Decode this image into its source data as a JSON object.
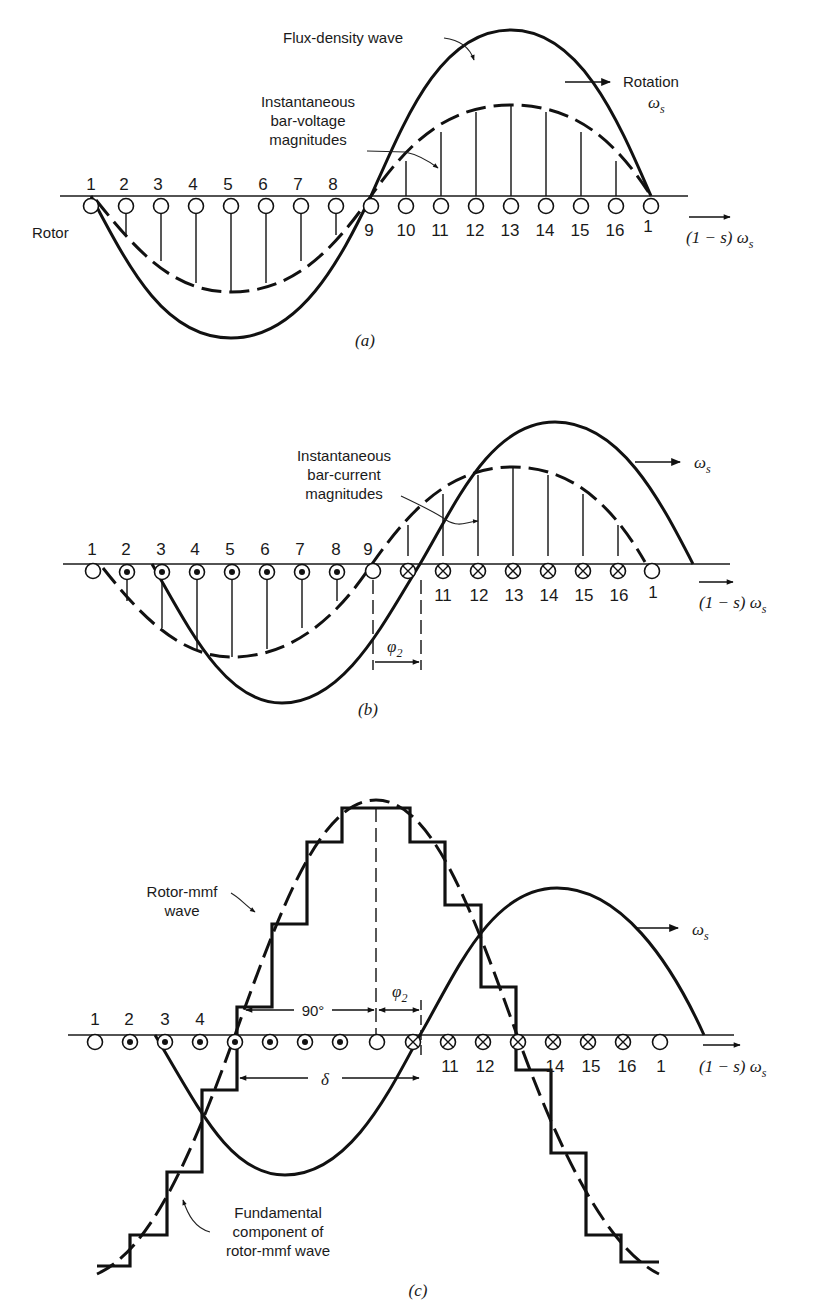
{
  "figure": {
    "panels": [
      {
        "id": "a",
        "caption": "(a)",
        "labels": {
          "flux_wave": "Flux-density wave",
          "bar_voltage": [
            "Instantaneous",
            "bar-voltage",
            "magnitudes"
          ],
          "rotation": "Rotation",
          "omega_s": "ω",
          "omega_sub": "s",
          "rotor": "Rotor",
          "rotor_speed": "(1 − s) ω",
          "rotor_speed_sub": "s"
        },
        "bar_numbers_top": [
          "1",
          "2",
          "3",
          "4",
          "5",
          "6",
          "7",
          "8"
        ],
        "bar_numbers_bottom": [
          "9",
          "10",
          "11",
          "12",
          "13",
          "14",
          "15",
          "16",
          "1"
        ],
        "conductor_symbols": [
          "open",
          "open",
          "open",
          "open",
          "open",
          "open",
          "open",
          "open",
          "open",
          "open",
          "open",
          "open",
          "open",
          "open",
          "open",
          "open",
          "open"
        ]
      },
      {
        "id": "b",
        "caption": "(b)",
        "labels": {
          "bar_current": [
            "Instantaneous",
            "bar-current",
            "magnitudes"
          ],
          "omega_s": "ω",
          "omega_sub": "s",
          "phi2": "φ",
          "phi2_sub": "2",
          "rotor_speed": "(1 − s) ω",
          "rotor_speed_sub": "s"
        },
        "bar_numbers_top": [
          "1",
          "2",
          "3",
          "4",
          "5",
          "6",
          "7",
          "8",
          "9"
        ],
        "bar_numbers_bottom": [
          "11",
          "12",
          "13",
          "14",
          "15",
          "16",
          "1"
        ],
        "conductor_symbols": [
          "open",
          "dot",
          "dot",
          "dot",
          "dot",
          "dot",
          "dot",
          "dot",
          "open",
          "cross",
          "cross",
          "cross",
          "cross",
          "cross",
          "cross",
          "cross",
          "open"
        ]
      },
      {
        "id": "c",
        "caption": "(c)",
        "labels": {
          "rotor_mmf": [
            "Rotor-mmf",
            "wave"
          ],
          "fundamental": [
            "Fundamental",
            "component of",
            "rotor-mmf wave"
          ],
          "angle_90": "90°",
          "delta": "δ",
          "phi2": "φ",
          "phi2_sub": "2",
          "omega_s": "ω",
          "omega_sub": "s",
          "rotor_speed": "(1 − s) ω",
          "rotor_speed_sub": "s"
        },
        "bar_numbers_top": [
          "1",
          "2",
          "3",
          "4"
        ],
        "bar_numbers_bottom": [
          "11",
          "12",
          "14",
          "15",
          "16",
          "1"
        ],
        "conductor_symbols": [
          "open",
          "dot",
          "dot",
          "dot",
          "dot",
          "dot",
          "dot",
          "dot",
          "open",
          "cross",
          "cross",
          "cross",
          "cross",
          "cross",
          "cross",
          "cross",
          "open"
        ]
      }
    ]
  }
}
